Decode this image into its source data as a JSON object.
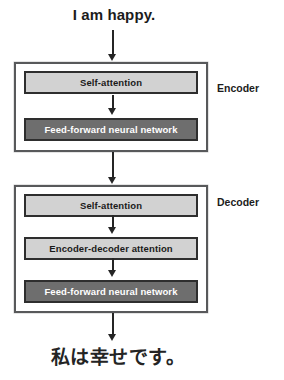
{
  "diagram": {
    "input_caption": "I am happy.",
    "output_caption": "私は幸せです。",
    "blocks": [
      {
        "side_label": "Encoder",
        "layers": [
          {
            "label": "Self-attention",
            "style": "light"
          },
          {
            "label": "Feed-forward neural network",
            "style": "dark"
          }
        ]
      },
      {
        "side_label": "Decoder",
        "layers": [
          {
            "label": "Self-attention",
            "style": "light"
          },
          {
            "label": "Encoder-decoder attention",
            "style": "light"
          },
          {
            "label": "Feed-forward neural network",
            "style": "dark"
          }
        ]
      }
    ],
    "colors": {
      "light_layer_fill": "#d2d2d2",
      "dark_layer_fill": "#6e6e6e",
      "layer_border": "#2e2e2e",
      "stack_border": "#58595b",
      "arrow": "#252525",
      "background": "#ffffff",
      "text_dark": "#1a1a1a",
      "text_light": "#ffffff"
    }
  }
}
